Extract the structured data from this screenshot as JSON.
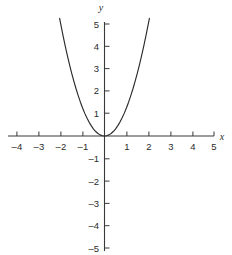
{
  "figure": {
    "name": "parabola-graph",
    "background_color": "#ffffff",
    "axis_color": "#3a3a3a",
    "curve_color": "#2b2b2b"
  },
  "chart_data": {
    "type": "line",
    "title": "",
    "subtitle": "",
    "xlabel": "x",
    "ylabel": "y",
    "xlim": [
      -5,
      5
    ],
    "ylim": [
      -5,
      5
    ],
    "grid": false,
    "legend": null,
    "xticks": [
      -4,
      -3,
      -2,
      -1,
      1,
      2,
      3,
      4,
      5
    ],
    "yticks": [
      -5,
      -4,
      -3,
      -2,
      -1,
      1,
      2,
      3,
      4,
      5
    ],
    "xtick_labels": [
      "–4",
      "–3",
      "–2",
      "–1",
      "1",
      "2",
      "3",
      "4",
      "5"
    ],
    "ytick_labels": [
      "–5",
      "–4",
      "–3",
      "–2",
      "–1",
      "1",
      "2",
      "3",
      "4",
      "5"
    ],
    "series": [
      {
        "name": "y = 1.25x²",
        "equation": "y = 1.25*x^2",
        "x_domain": [
          -2.05,
          2.05
        ],
        "x": [
          -2.05,
          -1.9,
          -1.8,
          -1.7,
          -1.6,
          -1.5,
          -1.4,
          -1.3,
          -1.2,
          -1.1,
          -1.0,
          -0.9,
          -0.8,
          -0.7,
          -0.6,
          -0.5,
          -0.4,
          -0.3,
          -0.2,
          -0.1,
          0.0,
          0.1,
          0.2,
          0.3,
          0.4,
          0.5,
          0.6,
          0.7,
          0.8,
          0.9,
          1.0,
          1.1,
          1.2,
          1.3,
          1.4,
          1.5,
          1.6,
          1.7,
          1.8,
          1.9,
          2.05
        ],
        "y": [
          5.25,
          4.51,
          4.05,
          3.61,
          3.2,
          2.81,
          2.45,
          2.11,
          1.8,
          1.51,
          1.25,
          1.01,
          0.8,
          0.61,
          0.45,
          0.31,
          0.2,
          0.11,
          0.05,
          0.01,
          0.0,
          0.01,
          0.05,
          0.11,
          0.2,
          0.31,
          0.45,
          0.61,
          0.8,
          1.01,
          1.25,
          1.51,
          1.8,
          2.11,
          2.45,
          2.81,
          3.2,
          3.61,
          4.05,
          4.51,
          5.25
        ],
        "vertex": [
          0,
          0
        ]
      }
    ]
  }
}
